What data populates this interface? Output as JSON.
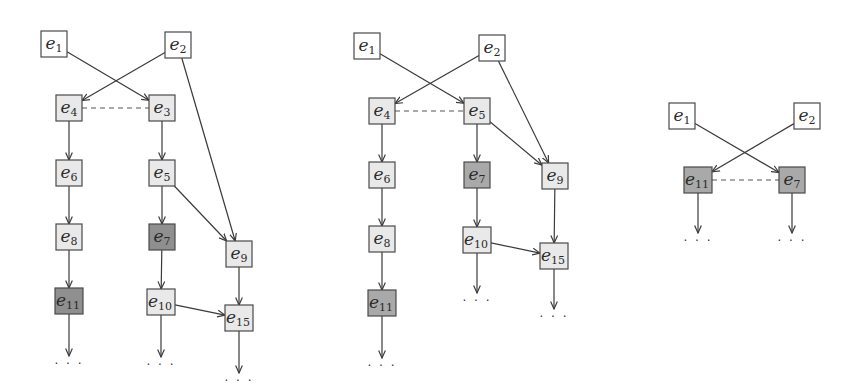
{
  "colors": {
    "white": "#ffffff",
    "light": "#e9e9e9",
    "medium": "#a9a9a9",
    "dark": "#8f8f8f",
    "stroke": "#4a4a4a"
  },
  "continuation_symbol": "· · ·",
  "diagrams": [
    {
      "id": "diagram-1",
      "nodes": [
        {
          "id": "e1",
          "base": "e",
          "sub": "1",
          "x": 41,
          "y": 31,
          "fill": "white"
        },
        {
          "id": "e2",
          "base": "e",
          "sub": "2",
          "x": 165,
          "y": 32,
          "fill": "white"
        },
        {
          "id": "e4",
          "base": "e",
          "sub": "4",
          "x": 56,
          "y": 95,
          "fill": "light"
        },
        {
          "id": "e3",
          "base": "e",
          "sub": "3",
          "x": 149,
          "y": 95,
          "fill": "light"
        },
        {
          "id": "e6",
          "base": "e",
          "sub": "6",
          "x": 56,
          "y": 160,
          "fill": "light"
        },
        {
          "id": "e5",
          "base": "e",
          "sub": "5",
          "x": 149,
          "y": 160,
          "fill": "light"
        },
        {
          "id": "e8",
          "base": "e",
          "sub": "8",
          "x": 56,
          "y": 224,
          "fill": "light"
        },
        {
          "id": "e7",
          "base": "e",
          "sub": "7",
          "x": 149,
          "y": 224,
          "fill": "dark"
        },
        {
          "id": "e9",
          "base": "e",
          "sub": "9",
          "x": 226,
          "y": 241,
          "fill": "light"
        },
        {
          "id": "e11",
          "base": "e",
          "sub": "11",
          "x": 55,
          "y": 288,
          "fill": "dark",
          "wide": true
        },
        {
          "id": "e10",
          "base": "e",
          "sub": "10",
          "x": 147,
          "y": 289,
          "fill": "light",
          "wide": true
        },
        {
          "id": "e15",
          "base": "e",
          "sub": "15",
          "x": 225,
          "y": 305,
          "fill": "light",
          "wide": true
        }
      ],
      "edges": [
        [
          "e1",
          "e3"
        ],
        [
          "e2",
          "e4"
        ],
        [
          "e2",
          "e9"
        ],
        [
          "e4",
          "e6"
        ],
        [
          "e6",
          "e8"
        ],
        [
          "e8",
          "e11"
        ],
        [
          "e3",
          "e5"
        ],
        [
          "e5",
          "e7"
        ],
        [
          "e5",
          "e9"
        ],
        [
          "e7",
          "e10"
        ],
        [
          "e9",
          "e15"
        ],
        [
          "e10",
          "e15"
        ]
      ],
      "dashed": [
        [
          "e4",
          "e3"
        ]
      ],
      "continuations": [
        "e11",
        "e10",
        "e15"
      ]
    },
    {
      "id": "diagram-2",
      "nodes": [
        {
          "id": "e1",
          "base": "e",
          "sub": "1",
          "x": 354,
          "y": 33,
          "fill": "white"
        },
        {
          "id": "e2",
          "base": "e",
          "sub": "2",
          "x": 479,
          "y": 35,
          "fill": "white"
        },
        {
          "id": "e4",
          "base": "e",
          "sub": "4",
          "x": 369,
          "y": 98,
          "fill": "light"
        },
        {
          "id": "e5",
          "base": "e",
          "sub": "5",
          "x": 464,
          "y": 98,
          "fill": "light"
        },
        {
          "id": "e6",
          "base": "e",
          "sub": "6",
          "x": 369,
          "y": 162,
          "fill": "light"
        },
        {
          "id": "e7",
          "base": "e",
          "sub": "7",
          "x": 464,
          "y": 162,
          "fill": "medium"
        },
        {
          "id": "e9",
          "base": "e",
          "sub": "9",
          "x": 542,
          "y": 163,
          "fill": "light"
        },
        {
          "id": "e8",
          "base": "e",
          "sub": "8",
          "x": 369,
          "y": 226,
          "fill": "light"
        },
        {
          "id": "e10",
          "base": "e",
          "sub": "10",
          "x": 463,
          "y": 227,
          "fill": "light",
          "wide": true
        },
        {
          "id": "e15",
          "base": "e",
          "sub": "15",
          "x": 540,
          "y": 243,
          "fill": "light",
          "wide": true
        },
        {
          "id": "e11",
          "base": "e",
          "sub": "11",
          "x": 368,
          "y": 290,
          "fill": "medium",
          "wide": true
        }
      ],
      "edges": [
        [
          "e1",
          "e5"
        ],
        [
          "e2",
          "e4"
        ],
        [
          "e2",
          "e9"
        ],
        [
          "e4",
          "e6"
        ],
        [
          "e6",
          "e8"
        ],
        [
          "e8",
          "e11"
        ],
        [
          "e5",
          "e7"
        ],
        [
          "e5",
          "e9"
        ],
        [
          "e7",
          "e10"
        ],
        [
          "e9",
          "e15"
        ],
        [
          "e10",
          "e15"
        ]
      ],
      "dashed": [
        [
          "e4",
          "e5"
        ]
      ],
      "continuations": [
        "e11",
        "e10",
        "e15"
      ]
    },
    {
      "id": "diagram-3",
      "nodes": [
        {
          "id": "e1",
          "base": "e",
          "sub": "1",
          "x": 669,
          "y": 103,
          "fill": "white"
        },
        {
          "id": "e2",
          "base": "e",
          "sub": "2",
          "x": 794,
          "y": 103,
          "fill": "white"
        },
        {
          "id": "e11",
          "base": "e",
          "sub": "11",
          "x": 684,
          "y": 167,
          "fill": "medium",
          "wide": true
        },
        {
          "id": "e7",
          "base": "e",
          "sub": "7",
          "x": 779,
          "y": 167,
          "fill": "medium"
        }
      ],
      "edges": [
        [
          "e1",
          "e7"
        ],
        [
          "e2",
          "e11"
        ]
      ],
      "dashed": [
        [
          "e11",
          "e7"
        ]
      ],
      "continuations": [
        "e11",
        "e7"
      ]
    }
  ]
}
